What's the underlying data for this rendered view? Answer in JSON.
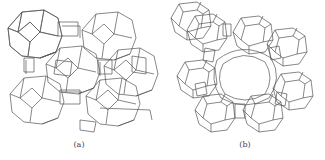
{
  "figure": {
    "panels": [
      {
        "id": "a",
        "label": "(a)",
        "description": "framework of sodalite cages linked by double four-membered rings"
      },
      {
        "id": "b",
        "label": "(b)",
        "description": "framework of sodalite cages linked by double six-membered rings around a central supercage"
      }
    ],
    "colors": {
      "line": "#555555",
      "background": "#ffffff",
      "caption": "#444444"
    }
  }
}
